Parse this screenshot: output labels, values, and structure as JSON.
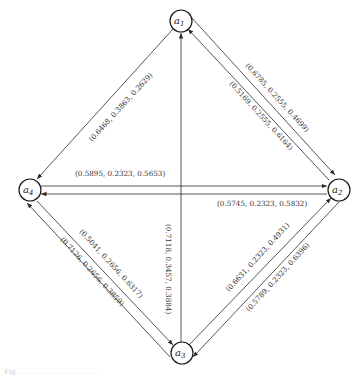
{
  "diagram": {
    "type": "directed-graph",
    "nodes": [
      {
        "id": "a1",
        "base": "a",
        "sub": "1"
      },
      {
        "id": "a2",
        "base": "a",
        "sub": "2"
      },
      {
        "id": "a3",
        "base": "a",
        "sub": "3"
      },
      {
        "id": "a4",
        "base": "a",
        "sub": "4"
      }
    ],
    "edges": [
      {
        "from": "a1",
        "to": "a2",
        "label": "(0.6785, 0.2555, 0.4699)"
      },
      {
        "from": "a2",
        "to": "a1",
        "label": "(0.5169, 0.2555, 0.6164)"
      },
      {
        "from": "a1",
        "to": "a4",
        "label": "(0.6468, 0.3863, 0.2629)"
      },
      {
        "from": "a4",
        "to": "a2",
        "label": "(0.5895, 0.2323, 0.5653)"
      },
      {
        "from": "a2",
        "to": "a4",
        "label": "(0.5745, 0.2323, 0.5832)"
      },
      {
        "from": "a4",
        "to": "a3",
        "label": "(0.5041, 0.2656, 0.6317)"
      },
      {
        "from": "a3",
        "to": "a4",
        "label": "(0.7126, 0.2656, 0.3859)"
      },
      {
        "from": "a3",
        "to": "a1",
        "label": "(0.7118, 0.3457, 0.3884)"
      },
      {
        "from": "a3",
        "to": "a2",
        "label": "(0.6631, 0.2323, 0.4931)"
      },
      {
        "from": "a2",
        "to": "a3",
        "label": "(0.5789, 0.2323, 0.6396)"
      }
    ]
  },
  "caption": "Fig. . . . . . . . . . . . . . . . . . ."
}
